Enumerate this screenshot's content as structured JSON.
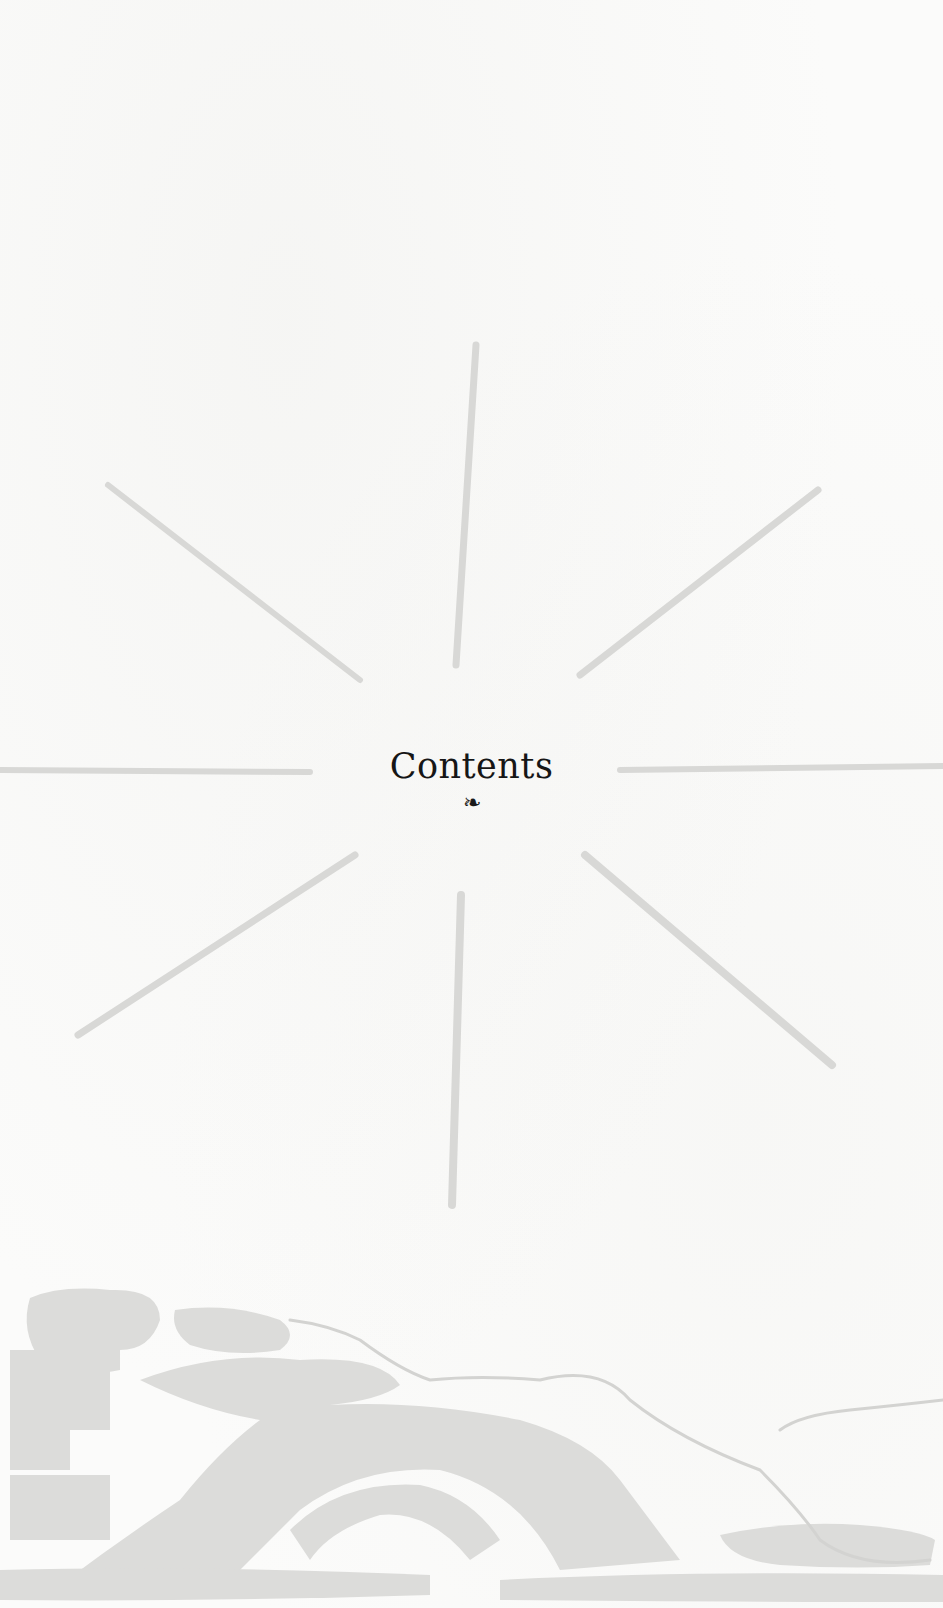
{
  "page": {
    "heading": "Contents",
    "ornament_glyph": "❧",
    "ornament_icon": "fleuron-ornament"
  },
  "illustration": {
    "sunburst": {
      "ray_count": 8,
      "ray_color": "#d6d6d4",
      "center": [
        462,
        770
      ]
    },
    "landscape": {
      "description": "faint woodcut landscape with hills and trees",
      "tint_color": "#d9d9d7",
      "line_color": "#cfcfcd"
    }
  },
  "colors": {
    "paper": "#fbfbfa",
    "ink": "#161616"
  }
}
